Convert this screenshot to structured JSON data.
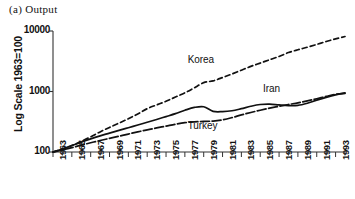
{
  "panel": {
    "title": "(a) Output"
  },
  "chart_data": {
    "type": "line",
    "title": "(a) Output",
    "xlabel": "",
    "ylabel": "Log Scale 1963=100",
    "yscale": "log",
    "ylim": [
      100,
      10000
    ],
    "xlim": [
      1963,
      1994
    ],
    "grid": false,
    "legend_position": "inline-annotations",
    "yticks": [
      "100",
      "1000",
      "10000"
    ],
    "ytick_values": [
      100,
      1000,
      10000
    ],
    "xticks": [
      "1963",
      "1965",
      "1967",
      "1969",
      "1971",
      "1973",
      "1975",
      "1977",
      "1979",
      "1981",
      "1983",
      "1985",
      "1987",
      "1989",
      "1991",
      "1993"
    ],
    "xtick_values": [
      1963,
      1965,
      1967,
      1969,
      1971,
      1973,
      1975,
      1977,
      1979,
      1981,
      1983,
      1985,
      1987,
      1989,
      1991,
      1993
    ],
    "x": [
      1963,
      1964,
      1965,
      1966,
      1967,
      1968,
      1969,
      1970,
      1971,
      1972,
      1973,
      1974,
      1975,
      1976,
      1977,
      1978,
      1979,
      1980,
      1981,
      1982,
      1983,
      1984,
      1985,
      1986,
      1987,
      1988,
      1989,
      1990,
      1991,
      1992,
      1993,
      1994
    ],
    "series": [
      {
        "name": "Korea",
        "style": "dashed",
        "color": "#111111",
        "values": [
          100,
          112,
          128,
          150,
          178,
          215,
          255,
          300,
          355,
          425,
          520,
          600,
          690,
          810,
          950,
          1150,
          1400,
          1500,
          1700,
          1950,
          2250,
          2600,
          2950,
          3350,
          3800,
          4400,
          4900,
          5400,
          6000,
          6700,
          7400,
          8100
        ]
      },
      {
        "name": "Iran",
        "style": "solid",
        "color": "#111111",
        "values": [
          100,
          112,
          128,
          145,
          165,
          185,
          205,
          228,
          252,
          280,
          310,
          345,
          385,
          430,
          490,
          545,
          560,
          470,
          465,
          480,
          520,
          570,
          610,
          620,
          600,
          585,
          590,
          640,
          720,
          800,
          880,
          950
        ]
      },
      {
        "name": "Turkey",
        "style": "dash-dot",
        "color": "#111111",
        "values": [
          100,
          108,
          118,
          130,
          142,
          155,
          168,
          182,
          198,
          215,
          232,
          250,
          268,
          288,
          305,
          315,
          320,
          325,
          340,
          370,
          410,
          450,
          490,
          530,
          570,
          610,
          650,
          700,
          760,
          830,
          900,
          930
        ]
      }
    ],
    "annotations": [
      {
        "text": "Korea",
        "x": 1979,
        "y": 3200
      },
      {
        "text": "Iran",
        "x": 1987,
        "y": 1050
      },
      {
        "text": "Turkey",
        "x": 1979,
        "y": 255
      }
    ]
  }
}
